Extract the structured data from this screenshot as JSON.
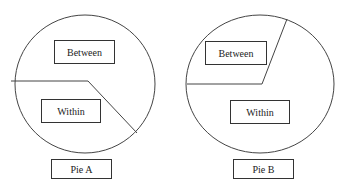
{
  "colors": {
    "stroke": "#444444",
    "background": "#ffffff",
    "text": "#222222"
  },
  "pies": [
    {
      "name": "Pie A",
      "label": "Pie A",
      "between_label": "Between",
      "within_label": "Within",
      "circle": {
        "cx": 85,
        "cy": 84,
        "rx": 70,
        "ry": 69
      },
      "divider_points": "11,81 88,81 137,133"
    },
    {
      "name": "Pie B",
      "label": "Pie B",
      "between_label": "Between",
      "within_label": "Within",
      "circle": {
        "cx": 260,
        "cy": 84,
        "rx": 74,
        "ry": 69
      },
      "divider_points": "187,84 262,84 287,19"
    }
  ]
}
